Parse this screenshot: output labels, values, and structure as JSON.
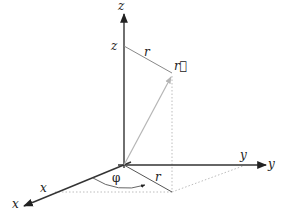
{
  "diagram": {
    "colors": {
      "axis": "#333333",
      "vector": "#b5b5b5",
      "dotted": "#bdbdbd",
      "label": "#222222"
    },
    "axes": {
      "z_label": "z",
      "y_label": "y",
      "x_label": "x"
    },
    "tick_labels": {
      "z": "z",
      "y": "y",
      "x": "x"
    },
    "vector_label": "r⃗",
    "radius_label_top": "r",
    "radius_label_bottom": "r",
    "angle_label": "φ"
  }
}
